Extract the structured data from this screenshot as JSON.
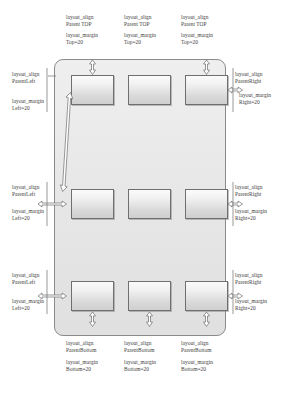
{
  "diagram": {
    "container_name": "relative-layout-container",
    "colors": {
      "container_border": "#8a8a8a",
      "container_fill": "#e6e6e6",
      "box_border": "#6f6f6f",
      "arrow_stroke": "#6d6d6d",
      "text": "#3d3d3d",
      "page_background": "#ffffff"
    }
  },
  "top_labels": [
    {
      "align": "layout_align\nParent TOP",
      "margin": "layout_margin\nTop=20"
    },
    {
      "align": "layout_align\nParent TOP",
      "margin": "layout_margin\nTop=20"
    },
    {
      "align": "layout_align\nParent TOP",
      "margin": "layout_margin\nTop=20"
    }
  ],
  "bottom_labels": [
    {
      "align": "layout_align\nParentBottom",
      "margin": "layout_margin\nBottom=20"
    },
    {
      "align": "layout_align\nParentBottom",
      "margin": "layout_margin\nBottom=20"
    },
    {
      "align": "layout_align\nParentBottom",
      "margin": "layout_margin\nBottom=20"
    }
  ],
  "left_labels": [
    {
      "align": "layout_align\nParentLeft",
      "margin": "layout_margin\nLeft=20"
    },
    {
      "align": "layout_align\nParentLeft",
      "margin": "layout_margin\nLeft=20"
    },
    {
      "align": "layout_align\nParentLeft",
      "margin": "layout_margin\nLeft=20"
    }
  ],
  "right_labels": [
    {
      "align": "layout_align\nParentRight",
      "margin": "layout_margin\nRight=20"
    },
    {
      "align": "layout_align\nParentRight",
      "margin": "layout_margin\nRight=20"
    },
    {
      "align": "layout_align\nParentRight",
      "margin": "layout_margin\nRight=20"
    }
  ],
  "center_labels": {
    "top": "android:layout_\ncenterHorizontal",
    "middle": "android:layout_\ncenterHorizontal"
  },
  "middle_row_labels": [
    "layout_center\nVertical",
    "layout_center\nVertical",
    "layout_center\nVertical"
  ],
  "boxes": {
    "row_top": [
      "box-top-left",
      "box-top-center",
      "box-top-right"
    ],
    "row_middle": [
      "box-middle-left",
      "box-middle-center",
      "box-middle-right"
    ],
    "row_bottom": [
      "box-bottom-left",
      "box-bottom-center",
      "box-bottom-right"
    ]
  }
}
